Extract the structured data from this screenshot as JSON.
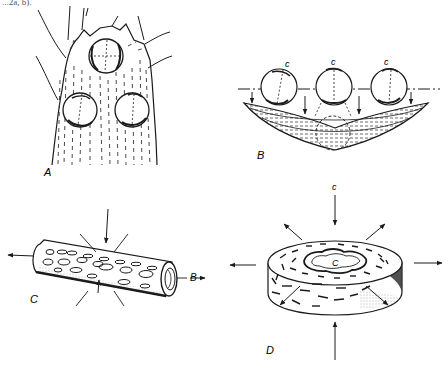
{
  "figure": {
    "caption_fragment": "...2a, b).",
    "panels": [
      {
        "id": "A",
        "label": "A",
        "description": "Stem apex with three spherical bodies embedded, dashed longitudinal lines, branching lateral strands"
      },
      {
        "id": "B",
        "label": "B",
        "description": "Three spheres labeled c aligned on a dash-dot axis above a curved lens-shaped hatched mass; arrows point downward",
        "sphere_labels": [
          "c",
          "c",
          "c"
        ]
      },
      {
        "id": "C",
        "label": "C",
        "description": "Cylinder with oval surface markings; arrows compress radially and extend along axis",
        "axis_label": "B"
      },
      {
        "id": "D",
        "label": "D",
        "description": "Flat ring/disk with short dash markings; vertical compression arrows and radial extension arrows",
        "top_label": "c",
        "center_label": "C"
      }
    ]
  },
  "colors": {
    "ink": "#1a1a1a",
    "paper": "#ffffff",
    "hatch": "#555555"
  }
}
